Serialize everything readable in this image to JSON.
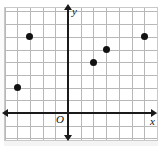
{
  "figure": {
    "type": "coordinate-plane-scatter",
    "axis_labels": {
      "x": "x",
      "y": "y",
      "origin": "O"
    },
    "colors": {
      "grid": "#b8b8b8",
      "axis": "#1a1a1a",
      "point": "#111111",
      "border": "#c9c9c9",
      "background": "#ffffff"
    }
  },
  "chart_data": {
    "type": "scatter",
    "title": "",
    "xlabel": "x",
    "ylabel": "y",
    "grid": true,
    "legend": null,
    "xlim": [
      -5,
      7
    ],
    "ylim": [
      -2,
      8
    ],
    "x": [
      -4,
      -3,
      2,
      3,
      6
    ],
    "y": [
      2,
      6,
      4,
      5,
      6
    ],
    "points": [
      {
        "x": -4,
        "y": 2
      },
      {
        "x": -3,
        "y": 6
      },
      {
        "x": 2,
        "y": 4
      },
      {
        "x": 3,
        "y": 5
      },
      {
        "x": 6,
        "y": 6
      }
    ],
    "xtick_labels": [],
    "ytick_labels": []
  },
  "geometry": {
    "cell_px": 12.7,
    "origin_px": {
      "x": 68,
      "y": 113
    },
    "grid_box": {
      "left": 5,
      "top": 8,
      "width": 152,
      "height": 132
    },
    "columns": 12,
    "rows": 10
  }
}
